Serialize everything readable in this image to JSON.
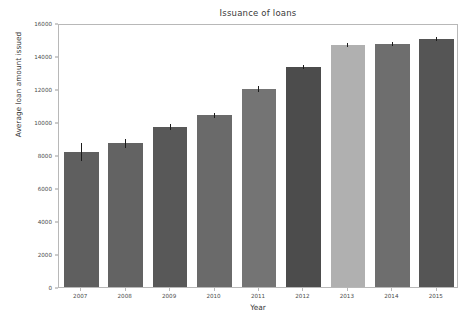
{
  "chart_data": {
    "type": "bar",
    "title": "Issuance of loans",
    "xlabel": "Year",
    "ylabel": "Average loan amount issued",
    "categories": [
      "2007",
      "2008",
      "2009",
      "2010",
      "2011",
      "2012",
      "2013",
      "2014",
      "2015"
    ],
    "values": [
      8200,
      8700,
      9700,
      10400,
      12000,
      13350,
      14650,
      14750,
      15050
    ],
    "errors": [
      550,
      250,
      200,
      150,
      180,
      120,
      130,
      120,
      110
    ],
    "bar_colors": [
      "#5f5f5f",
      "#636363",
      "#585858",
      "#6a6a6a",
      "#747474",
      "#4c4c4c",
      "#b0b0b0",
      "#6e6e6e",
      "#555555"
    ],
    "ylim": [
      0,
      16000
    ],
    "yticks": [
      0,
      2000,
      4000,
      6000,
      8000,
      10000,
      12000,
      14000,
      16000
    ],
    "ytick_labels": [
      "0",
      "2000",
      "4000",
      "6000",
      "8000",
      "10000",
      "12000",
      "14000",
      "16000"
    ],
    "grid": false,
    "legend": null,
    "errorbar_color": "#1c1c1c",
    "axes_color": "#b8b8b8",
    "background": "#ffffff"
  }
}
